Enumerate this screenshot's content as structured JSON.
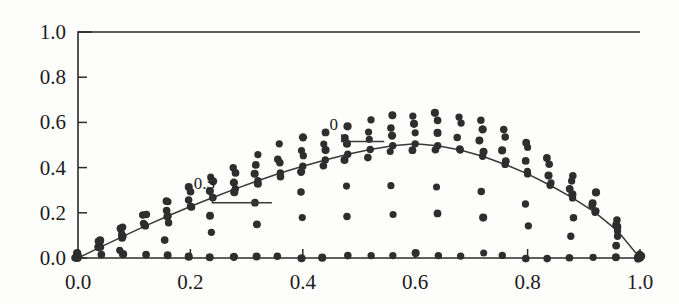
{
  "figure": {
    "background_color": "#fdfdfc",
    "ink_color": "#2e2e2e",
    "axis_color": "#2b2b2b"
  },
  "chart_data": {
    "type": "scatter",
    "title": "",
    "subtitle": "",
    "xlabel": "",
    "ylabel": "",
    "xlim": [
      0.0,
      1.0
    ],
    "ylim": [
      0.0,
      1.0
    ],
    "grid": false,
    "legend": "none",
    "xticks": [
      0.0,
      0.2,
      0.4,
      0.6,
      0.8,
      1.0
    ],
    "xticklabels": [
      "0.0",
      "0.2",
      "0.4",
      "0.6",
      "0.8",
      "1.0"
    ],
    "yticks": [
      0.0,
      0.2,
      0.4,
      0.6,
      0.8,
      1.0
    ],
    "yticklabels": [
      "0.0",
      "0.2",
      "0.4",
      "0.6",
      "0.8",
      "1.0"
    ],
    "minor_xticks": [
      0.04,
      0.08,
      0.12,
      0.16,
      0.24,
      0.28,
      0.32,
      0.36,
      0.44,
      0.48,
      0.52,
      0.56,
      0.64,
      0.68,
      0.72,
      0.76,
      0.84,
      0.88,
      0.92,
      0.96
    ],
    "marker": "filled-circle",
    "marker_size_px": 8,
    "annotations": [
      {
        "text": "0.5",
        "x": 0.225,
        "y": 0.305,
        "leader_to_x": 0.345,
        "leader_to_y": 0.245
      },
      {
        "text": "0",
        "x": 0.455,
        "y": 0.565,
        "leader_to_x": 0.545,
        "leader_to_y": 0.515
      }
    ],
    "series": [
      {
        "name": "envelope-curve-0",
        "note": "solid traced line following the 0 level curve",
        "style": "line",
        "x": [
          0.0,
          0.04,
          0.08,
          0.12,
          0.16,
          0.2,
          0.24,
          0.28,
          0.32,
          0.36,
          0.4,
          0.44,
          0.48,
          0.52,
          0.56,
          0.6,
          0.64,
          0.68,
          0.72,
          0.76,
          0.8,
          0.84,
          0.88,
          0.92,
          0.96,
          1.0
        ],
        "values": [
          0.0,
          0.048,
          0.096,
          0.142,
          0.186,
          0.228,
          0.268,
          0.306,
          0.342,
          0.376,
          0.406,
          0.434,
          0.459,
          0.48,
          0.497,
          0.505,
          0.497,
          0.478,
          0.45,
          0.414,
          0.372,
          0.322,
          0.266,
          0.202,
          0.12,
          0.0
        ]
      },
      {
        "name": "band-upper",
        "style": "dots",
        "x": [
          0.0,
          0.04,
          0.08,
          0.12,
          0.16,
          0.2,
          0.24,
          0.28,
          0.32,
          0.36,
          0.4,
          0.44,
          0.48,
          0.52,
          0.56,
          0.6,
          0.64,
          0.68,
          0.72,
          0.76,
          0.8,
          0.84,
          0.88,
          0.92,
          0.96,
          1.0
        ],
        "values": [
          0.0,
          0.07,
          0.135,
          0.196,
          0.254,
          0.308,
          0.358,
          0.404,
          0.446,
          0.484,
          0.518,
          0.548,
          0.574,
          0.596,
          0.614,
          0.628,
          0.636,
          0.63,
          0.606,
          0.566,
          0.512,
          0.444,
          0.364,
          0.272,
          0.16,
          0.0
        ]
      },
      {
        "name": "band-upper-2",
        "style": "dots",
        "x": [
          0.0,
          0.04,
          0.08,
          0.12,
          0.16,
          0.2,
          0.24,
          0.28,
          0.32,
          0.36,
          0.4,
          0.44,
          0.48,
          0.52,
          0.56,
          0.6,
          0.64,
          0.68,
          0.72,
          0.76,
          0.8,
          0.84,
          0.88,
          0.92,
          0.96,
          1.0
        ],
        "values": [
          0.0,
          0.062,
          0.12,
          0.176,
          0.228,
          0.278,
          0.324,
          0.368,
          0.408,
          0.444,
          0.478,
          0.508,
          0.534,
          0.556,
          0.574,
          0.588,
          0.592,
          0.584,
          0.56,
          0.522,
          0.47,
          0.406,
          0.332,
          0.248,
          0.146,
          0.0
        ]
      },
      {
        "name": "band-mid-1",
        "style": "dots",
        "x": [
          0.0,
          0.04,
          0.08,
          0.12,
          0.16,
          0.2,
          0.24,
          0.28,
          0.32,
          0.36,
          0.4,
          0.44,
          0.48,
          0.52,
          0.56,
          0.6,
          0.64,
          0.68,
          0.72,
          0.76,
          0.8,
          0.84,
          0.88,
          0.92,
          0.96,
          1.0
        ],
        "values": [
          0.0,
          0.054,
          0.106,
          0.156,
          0.204,
          0.25,
          0.292,
          0.332,
          0.37,
          0.404,
          0.436,
          0.464,
          0.488,
          0.51,
          0.528,
          0.54,
          0.544,
          0.536,
          0.514,
          0.478,
          0.43,
          0.372,
          0.304,
          0.226,
          0.132,
          0.0
        ]
      },
      {
        "name": "band-mid-2",
        "style": "dots",
        "x": [
          0.0,
          0.04,
          0.08,
          0.12,
          0.16,
          0.2,
          0.24,
          0.28,
          0.32,
          0.36,
          0.4,
          0.44,
          0.48,
          0.52,
          0.56,
          0.6,
          0.64,
          0.68,
          0.72,
          0.76,
          0.8,
          0.84,
          0.88,
          0.92,
          0.96,
          1.0
        ],
        "values": [
          0.0,
          0.044,
          0.088,
          0.13,
          0.17,
          0.208,
          0.246,
          0.282,
          0.316,
          0.348,
          0.378,
          0.404,
          0.428,
          0.448,
          0.464,
          0.474,
          0.476,
          0.468,
          0.448,
          0.416,
          0.374,
          0.324,
          0.266,
          0.198,
          0.116,
          0.0
        ]
      },
      {
        "name": "sparse-curve-a",
        "style": "dots",
        "x": [
          0.0,
          0.08,
          0.16,
          0.24,
          0.32,
          0.4,
          0.48,
          0.56,
          0.64,
          0.72,
          0.8,
          0.88,
          0.96,
          1.0
        ],
        "values": [
          0.0,
          0.07,
          0.134,
          0.192,
          0.244,
          0.286,
          0.314,
          0.326,
          0.318,
          0.288,
          0.238,
          0.168,
          0.086,
          0.0
        ]
      },
      {
        "name": "sparse-curve-b",
        "style": "dots",
        "x": [
          0.0,
          0.08,
          0.16,
          0.24,
          0.32,
          0.4,
          0.48,
          0.56,
          0.64,
          0.72,
          0.8,
          0.88,
          0.96,
          1.0
        ],
        "values": [
          0.0,
          0.04,
          0.076,
          0.11,
          0.138,
          0.16,
          0.176,
          0.182,
          0.178,
          0.162,
          0.134,
          0.096,
          0.05,
          0.0
        ]
      },
      {
        "name": "baseline-zero",
        "style": "dots",
        "x": [
          0.0,
          0.04,
          0.08,
          0.12,
          0.16,
          0.2,
          0.24,
          0.28,
          0.32,
          0.36,
          0.4,
          0.44,
          0.48,
          0.52,
          0.56,
          0.6,
          0.64,
          0.68,
          0.72,
          0.76,
          0.8,
          0.84,
          0.88,
          0.92,
          0.96,
          1.0
        ],
        "values": [
          0,
          0,
          0,
          0,
          0,
          0,
          0,
          0,
          0,
          0,
          0,
          0,
          0,
          0,
          0,
          0,
          0,
          0,
          0,
          0,
          0,
          0,
          0,
          0,
          0,
          0
        ]
      }
    ]
  }
}
